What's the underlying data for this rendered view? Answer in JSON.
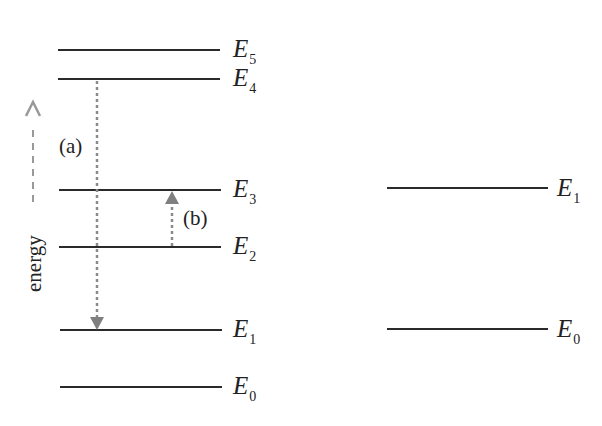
{
  "diagram": {
    "left_levels": [
      {
        "name": "E",
        "sub": "5",
        "y": 50
      },
      {
        "name": "E",
        "sub": "4",
        "y": 79
      },
      {
        "name": "E",
        "sub": "3",
        "y": 190
      },
      {
        "name": "E",
        "sub": "2",
        "y": 247
      },
      {
        "name": "E",
        "sub": "1",
        "y": 330
      },
      {
        "name": "E",
        "sub": "0",
        "y": 387
      }
    ],
    "right_levels": [
      {
        "name": "E",
        "sub": "1",
        "y": 188
      },
      {
        "name": "E",
        "sub": "0",
        "y": 329
      }
    ],
    "transitions": [
      {
        "label": "(a)",
        "from": "E4",
        "to": "E1",
        "direction": "down"
      },
      {
        "label": "(b)",
        "from": "E2",
        "to": "E3",
        "direction": "up"
      }
    ],
    "axis_label": "energy",
    "colors": {
      "line": "#2a2a2a",
      "arrow": "#8a8a8a"
    }
  }
}
